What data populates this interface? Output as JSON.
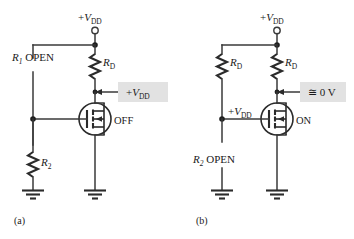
{
  "figure": {
    "background_color": "#ffffff",
    "line_color": "#3a3a3a",
    "callout_fill": "#e2e2e2"
  },
  "panel_a": {
    "caption": "(a)",
    "supply_label_prefix": "+",
    "supply_label_var": "V",
    "supply_label_sub": "DD",
    "open_resistor_name": "R",
    "open_resistor_sub": "1",
    "open_resistor_state": "OPEN",
    "drain_resistor_name": "R",
    "drain_resistor_sub": "D",
    "lower_resistor_name": "R",
    "lower_resistor_sub": "2",
    "callout_prefix": "+",
    "callout_var": "V",
    "callout_sub": "DD",
    "transistor_state": "OFF"
  },
  "panel_b": {
    "caption": "(b)",
    "supply_label_prefix": "+",
    "supply_label_var": "V",
    "supply_label_sub": "DD",
    "left_resistor_name": "R",
    "left_resistor_sub": "D",
    "drain_resistor_name": "R",
    "drain_resistor_sub": "D",
    "open_resistor_name": "R",
    "open_resistor_sub": "2",
    "open_resistor_state": "OPEN",
    "gate_label_prefix": "+",
    "gate_label_var": "V",
    "gate_label_sub": "DD",
    "callout_text": "≅ 0 V",
    "transistor_state": "ON"
  }
}
